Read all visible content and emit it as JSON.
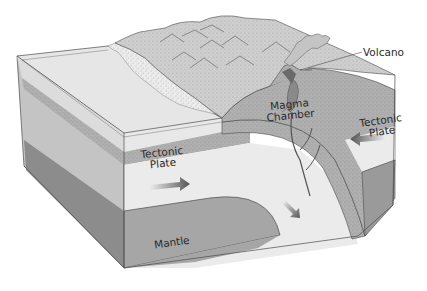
{
  "diagram": {
    "labels": {
      "volcano": "Volcano",
      "magma_chamber_line1": "Magma",
      "magma_chamber_line2": "Chamber",
      "tectonic_plate_right_line1": "Tectonic",
      "tectonic_plate_right_line2": "Plate",
      "tectonic_plate_left_line1": "Tectonic",
      "tectonic_plate_left_line2": "Plate",
      "mantle": "Mantle"
    },
    "arrows": [
      {
        "name": "left-plate-motion",
        "direction": "right"
      },
      {
        "name": "right-plate-motion",
        "direction": "left"
      },
      {
        "name": "subduction-motion",
        "direction": "down-right"
      }
    ],
    "colors": {
      "ocean_top": "#e6e6e6",
      "continent_top": "#d4d4d4",
      "plate_light": "#ebebeb",
      "crust_band": "#a8a8a8",
      "continental_crust": "#b3b3b3",
      "mantle": "#a6a6a6",
      "mantle_side": "#8c8c8c",
      "arrow": "#555555",
      "outline": "#4a4a4a"
    }
  }
}
